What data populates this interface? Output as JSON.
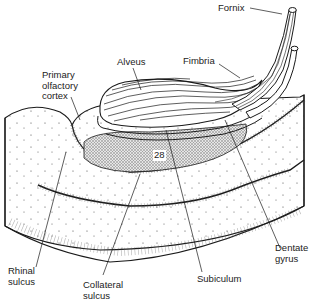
{
  "diagram": {
    "type": "anatomical illustration",
    "labels": {
      "fornix": "Fornix",
      "fimbria": "Fimbria",
      "alveus": "Alveus",
      "primary_olfactory_cortex": "Primary\nolfactory\ncortex",
      "area_28": "28",
      "rhinal_sulcus": "Rhinal\nsulcus",
      "collateral_sulcus": "Collateral\nsulcus",
      "subiculum": "Subiculum",
      "dentate_gyrus": "Dentate\ngyrus"
    },
    "colors": {
      "ink": "#1a1a1a",
      "background": "#ffffff",
      "stipple_fill": "#cfcfcf"
    }
  }
}
